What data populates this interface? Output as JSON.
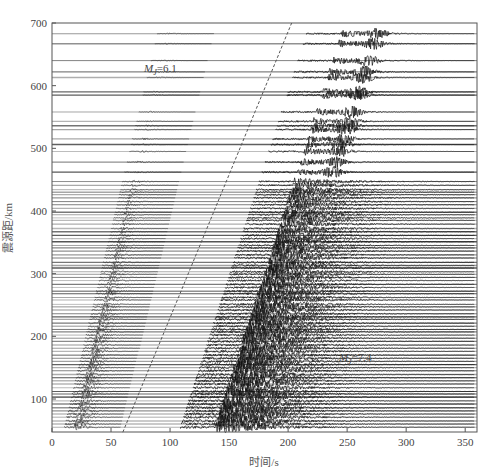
{
  "chart_data": {
    "type": "scatter",
    "subtype": "seismic-record-section",
    "title": "",
    "xlabel": "时间/s",
    "ylabel": "震源距/km",
    "xlim": [
      0,
      360
    ],
    "ylim": [
      47,
      700
    ],
    "xticks": [
      0,
      50,
      100,
      150,
      200,
      250,
      300,
      350
    ],
    "yticks": [
      100,
      200,
      300,
      400,
      500,
      600,
      700
    ],
    "grid": false,
    "legend": null,
    "annotations": [
      {
        "text": "M",
        "sub": "J",
        "suffix": "=6.1",
        "x": 78,
        "y": 622
      },
      {
        "text": "M",
        "sub": "J",
        "suffix": "=7.4",
        "x": 243,
        "y": 160
      }
    ],
    "reference_line": {
      "style": "dashed",
      "points": [
        [
          60,
          47
        ],
        [
          203,
          700
        ]
      ],
      "description": "linear moveout line"
    },
    "events": [
      {
        "name": "MJ 6.1 foreshock",
        "p_arrival_at_50km": 18,
        "slowness_s_per_km": 0.125
      },
      {
        "name": "MJ 7.4 mainshock",
        "p_arrival_at_50km": 138,
        "slowness_s_per_km": 0.17
      }
    ],
    "trace_distances_km": [
      683,
      667,
      640,
      622,
      613,
      590,
      585,
      558,
      543,
      536,
      530,
      515,
      506,
      495,
      478,
      462,
      447,
      441,
      434,
      430,
      426,
      421,
      415,
      410,
      404,
      398,
      394,
      389,
      385,
      379,
      372,
      367,
      361,
      356,
      351,
      345,
      341,
      336,
      330,
      325,
      318,
      313,
      309,
      303,
      299,
      294,
      289,
      283,
      278,
      272,
      268,
      262,
      258,
      251,
      247,
      242,
      236,
      231,
      227,
      221,
      216,
      211,
      207,
      202,
      197,
      192,
      186,
      181,
      176,
      170,
      165,
      160,
      155,
      150,
      145,
      139,
      134,
      129,
      124,
      118,
      112,
      108,
      103,
      97,
      92,
      86,
      81,
      76,
      71,
      65,
      60,
      55
    ]
  },
  "axes": {
    "x_title": "时间/s",
    "y_title": "震源距/km",
    "x_tick_labels": [
      "0",
      "50",
      "100",
      "150",
      "200",
      "250",
      "300",
      "350"
    ],
    "y_tick_labels": [
      "100",
      "200",
      "300",
      "400",
      "500",
      "600",
      "700"
    ]
  },
  "colors": {
    "trace": "#111111",
    "frame": "#555555",
    "reference_line": "#555555"
  }
}
